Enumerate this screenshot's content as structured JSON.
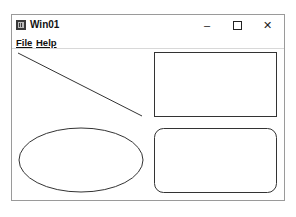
{
  "window": {
    "title": "Win01",
    "controls": {
      "minimize": "–",
      "maximize": "□",
      "close": "✕"
    }
  },
  "menubar": {
    "items": [
      {
        "label": "File"
      },
      {
        "label": "Help"
      }
    ]
  },
  "drawing": {
    "stroke": "#333333",
    "shapes": [
      {
        "type": "line",
        "x1": 18,
        "y1": 53,
        "x2": 142,
        "y2": 116
      },
      {
        "type": "rectangle",
        "x": 154,
        "y": 52,
        "w": 122,
        "h": 64
      },
      {
        "type": "ellipse",
        "cx": 81,
        "cy": 160,
        "rx": 62,
        "ry": 32
      },
      {
        "type": "rounded-rectangle",
        "x": 154,
        "y": 128,
        "w": 122,
        "h": 64,
        "r": 9
      }
    ]
  }
}
